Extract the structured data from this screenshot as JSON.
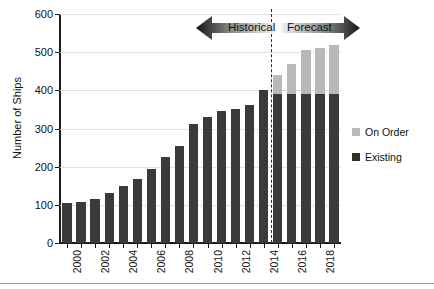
{
  "chart_data": {
    "type": "bar",
    "stacked": true,
    "title": "",
    "xlabel": "",
    "ylabel": "Number of Ships",
    "ylim": [
      0,
      600
    ],
    "ytick_values": [
      0,
      100,
      200,
      300,
      400,
      500,
      600
    ],
    "ytick_labels": [
      "0",
      "100",
      "200",
      "300",
      "400",
      "500",
      "600"
    ],
    "grid": true,
    "legend_position": "right",
    "categories": [
      "2000",
      "2001",
      "2002",
      "2003",
      "2004",
      "2005",
      "2006",
      "2007",
      "2008",
      "2009",
      "2010",
      "2011",
      "2012",
      "2013",
      "2014",
      "2015",
      "2016",
      "2017",
      "2018",
      "2019"
    ],
    "xtick_labels_shown": [
      "2000",
      "2002",
      "2004",
      "2006",
      "2008",
      "2010",
      "2012",
      "2014",
      "2016",
      "2018"
    ],
    "series": [
      {
        "name": "Existing",
        "color": "#3a3a3a",
        "values": [
          105,
          108,
          115,
          130,
          150,
          168,
          193,
          225,
          255,
          312,
          330,
          345,
          350,
          362,
          400,
          390,
          390,
          390,
          390,
          390
        ]
      },
      {
        "name": "On Order",
        "color": "#b9b9b9",
        "values": [
          0,
          0,
          0,
          0,
          0,
          0,
          0,
          0,
          0,
          0,
          0,
          0,
          0,
          0,
          0,
          50,
          80,
          115,
          120,
          130
        ]
      }
    ],
    "totals": [
      105,
      108,
      115,
      130,
      150,
      168,
      193,
      225,
      255,
      312,
      330,
      345,
      350,
      362,
      400,
      440,
      470,
      505,
      510,
      520
    ],
    "annotations": {
      "divider_after_category": "2015",
      "divider_style": "dashed",
      "bands": [
        {
          "label": "Historical",
          "direction": "left",
          "range": [
            "2000",
            "2015"
          ]
        },
        {
          "label": "Forecast",
          "direction": "right",
          "range": [
            "2016",
            "2019"
          ]
        }
      ]
    }
  },
  "legend": {
    "items": [
      {
        "label": "On Order",
        "color": "#b9b9b9"
      },
      {
        "label": "Existing",
        "color": "#2f2f2f"
      }
    ]
  },
  "axis": {
    "y_title": "Number of Ships"
  },
  "bands": {
    "historical_label": "Historical",
    "forecast_label": "Forecast"
  }
}
